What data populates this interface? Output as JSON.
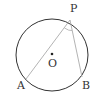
{
  "diagram": {
    "type": "circle-inscribed-angle",
    "circle": {
      "cx": 52,
      "cy": 55,
      "r": 36,
      "stroke": "#333333"
    },
    "points": {
      "P": {
        "label": "P",
        "x": 70,
        "y": 20
      },
      "A": {
        "label": "A",
        "x": 26,
        "y": 79
      },
      "B": {
        "label": "B",
        "x": 82,
        "y": 77
      },
      "O": {
        "label": "O",
        "x": 52,
        "y": 54
      }
    },
    "chords": [
      {
        "from": "P",
        "to": "A",
        "stroke": "#aaaaaa"
      },
      {
        "from": "P",
        "to": "B",
        "stroke": "#aaaaaa"
      }
    ],
    "angle_mark": {
      "at": "P",
      "between": [
        "A",
        "B"
      ]
    }
  }
}
